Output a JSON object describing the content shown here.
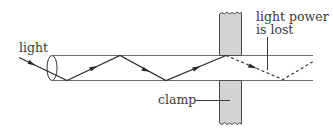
{
  "diagram": {
    "labels": {
      "light": "light",
      "light_power_line1": "light power",
      "light_power_line2": "is lost",
      "clamp": "clamp"
    },
    "colors": {
      "line": "#3a3a3a",
      "fibre_edge": "#6e6e6e",
      "clamp_fill": "#d4d4d4",
      "clamp_edge": "#4a4a4a",
      "text": "#3a3a3a"
    },
    "elements": [
      "incoming light ray with arrow",
      "optical fibre (cylinder with elliptical end face)",
      "zig-zag ray of total internal reflection with arrows",
      "clamp (upper and lower grey blocks pressing fibre)",
      "dashed ray showing escaping light beyond clamp"
    ]
  }
}
